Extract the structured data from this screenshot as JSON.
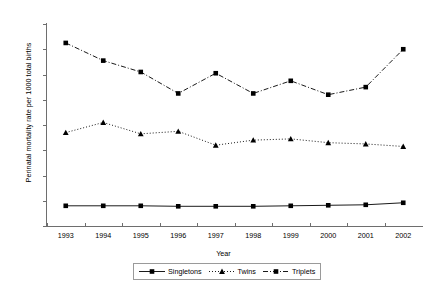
{
  "chart_data": {
    "type": "line",
    "title": "",
    "xlabel": "Year",
    "ylabel": "Perinatal mortality rate per 1000 total births",
    "categories": [
      "1993",
      "1994",
      "1995",
      "1996",
      "1997",
      "1998",
      "1999",
      "2000",
      "2001",
      "2002"
    ],
    "x": [
      1993,
      1994,
      1995,
      1996,
      1997,
      1998,
      1999,
      2000,
      2001,
      2002
    ],
    "ylim": [
      0,
      80
    ],
    "yticks": [
      0,
      10,
      20,
      30,
      40,
      50,
      60,
      70,
      80
    ],
    "grid": false,
    "legend_position": "bottom-center",
    "series": [
      {
        "name": "Singletons",
        "marker": "square",
        "linestyle": "solid",
        "color": "#000000",
        "values": [
          8,
          8,
          8,
          7.8,
          7.8,
          7.8,
          8,
          8.2,
          8.4,
          9.2
        ]
      },
      {
        "name": "Twins",
        "marker": "triangle",
        "linestyle": "dotted",
        "color": "#000000",
        "values": [
          37,
          41,
          36.5,
          37.5,
          32,
          34,
          34.5,
          33,
          32.5,
          31.5
        ]
      },
      {
        "name": "Triplets",
        "marker": "square",
        "linestyle": "dash-dot",
        "color": "#000000",
        "values": [
          72.5,
          65.5,
          61,
          52.5,
          60.5,
          52.5,
          57.5,
          52,
          55,
          70
        ]
      }
    ]
  },
  "axes": {
    "ylabel": "Perinatal mortality rate per 1000 total births",
    "xlabel": "Year"
  },
  "legend": {
    "items": [
      {
        "label": "Singletons"
      },
      {
        "label": "Twins"
      },
      {
        "label": "Triplets"
      }
    ]
  }
}
